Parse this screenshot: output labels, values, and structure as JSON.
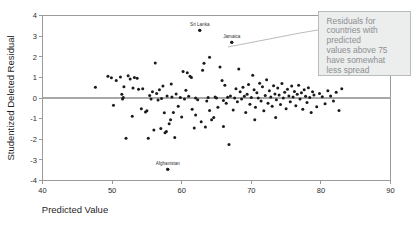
{
  "chart_data": {
    "type": "scatter",
    "title": "",
    "xlabel": "Predicted Value",
    "ylabel": "Studentized Deleted Residual",
    "xlim": [
      40,
      90
    ],
    "ylim": [
      -4,
      4
    ],
    "xticks": [
      40,
      50,
      60,
      70,
      80,
      90
    ],
    "yticks": [
      4,
      3,
      2,
      1,
      0,
      -1,
      -2,
      -3,
      -4
    ],
    "xtick_labels": [
      "40",
      "50",
      "60",
      "70",
      "80",
      "90"
    ],
    "ytick_labels": [
      "4",
      "3",
      "2",
      "1",
      "0",
      "-1",
      "-2",
      "-3",
      "-4"
    ],
    "grid": false,
    "legend": false,
    "reference_line": {
      "axis": "y",
      "value": 0,
      "color": "#a8a8a8"
    },
    "marker": {
      "shape": "circle",
      "color": "#1a1a1a",
      "size": 1.5
    },
    "points": [
      [
        47.6,
        0.52
      ],
      [
        49.4,
        1.05
      ],
      [
        49.9,
        0.98
      ],
      [
        50.2,
        -0.35
      ],
      [
        50.6,
        0.85
      ],
      [
        51.2,
        1.02
      ],
      [
        51.4,
        0.18
      ],
      [
        51.5,
        -0.05
      ],
      [
        51.6,
        0.02
      ],
      [
        51.7,
        0.55
      ],
      [
        52.0,
        -1.95
      ],
      [
        52.3,
        1.08
      ],
      [
        52.6,
        0.92
      ],
      [
        52.9,
        -0.88
      ],
      [
        53.2,
        1.0
      ],
      [
        53.6,
        0.96
      ],
      [
        53.8,
        0.42
      ],
      [
        54.2,
        -0.52
      ],
      [
        54.4,
        0.45
      ],
      [
        54.8,
        -0.68
      ],
      [
        55.0,
        -0.62
      ],
      [
        55.2,
        -1.95
      ],
      [
        55.4,
        0.12
      ],
      [
        55.6,
        -0.05
      ],
      [
        55.8,
        0.3
      ],
      [
        56.0,
        -1.55
      ],
      [
        56.2,
        1.7
      ],
      [
        56.4,
        0.22
      ],
      [
        56.6,
        -0.1
      ],
      [
        56.8,
        0.4
      ],
      [
        57.0,
        -1.48
      ],
      [
        57.1,
        -0.02
      ],
      [
        57.3,
        0.58
      ],
      [
        57.5,
        -0.72
      ],
      [
        57.6,
        -1.68
      ],
      [
        57.8,
        -1.62
      ],
      [
        57.9,
        0.1
      ],
      [
        58.0,
        -3.45
      ],
      [
        58.2,
        -1.25
      ],
      [
        58.4,
        -1.05
      ],
      [
        58.6,
        0.05
      ],
      [
        58.8,
        -0.7
      ],
      [
        59.0,
        -1.92
      ],
      [
        59.2,
        0.2
      ],
      [
        59.5,
        -0.4
      ],
      [
        59.8,
        0.03
      ],
      [
        60.2,
        1.28
      ],
      [
        60.4,
        -0.05
      ],
      [
        60.6,
        0.38
      ],
      [
        60.8,
        1.22
      ],
      [
        61.0,
        0.08
      ],
      [
        61.2,
        1.05
      ],
      [
        61.4,
        1.0
      ],
      [
        61.5,
        -0.55
      ],
      [
        61.8,
        -1.45
      ],
      [
        62.0,
        0.0
      ],
      [
        62.3,
        -0.08
      ],
      [
        62.6,
        3.28
      ],
      [
        62.8,
        -1.15
      ],
      [
        63.0,
        1.35
      ],
      [
        63.2,
        1.68
      ],
      [
        63.4,
        -1.4
      ],
      [
        63.6,
        -0.15
      ],
      [
        63.8,
        0.02
      ],
      [
        64.0,
        -0.6
      ],
      [
        64.3,
        -1.05
      ],
      [
        64.6,
        -0.95
      ],
      [
        64.8,
        0.05
      ],
      [
        65.0,
        0.0
      ],
      [
        65.2,
        -0.45
      ],
      [
        65.5,
        1.5
      ],
      [
        65.8,
        0.85
      ],
      [
        66.0,
        -0.12
      ],
      [
        66.2,
        0.62
      ],
      [
        66.4,
        -0.25
      ],
      [
        66.6,
        0.04
      ],
      [
        66.8,
        -2.25
      ],
      [
        67.0,
        0.1
      ],
      [
        67.2,
        2.7
      ],
      [
        67.4,
        -0.58
      ],
      [
        67.6,
        0.0
      ],
      [
        67.8,
        0.45
      ],
      [
        68.0,
        -0.18
      ],
      [
        68.2,
        1.4
      ],
      [
        68.4,
        0.3
      ],
      [
        68.6,
        -0.05
      ],
      [
        68.8,
        0.52
      ],
      [
        69.0,
        0.08
      ],
      [
        69.2,
        -0.7
      ],
      [
        69.4,
        0.18
      ],
      [
        69.6,
        0.66
      ],
      [
        69.8,
        -0.3
      ],
      [
        70.0,
        0.02
      ],
      [
        70.2,
        1.1
      ],
      [
        70.4,
        0.4
      ],
      [
        70.6,
        -0.45
      ],
      [
        70.8,
        0.25
      ],
      [
        71.0,
        0.0
      ],
      [
        71.2,
        0.72
      ],
      [
        71.4,
        -0.15
      ],
      [
        71.6,
        0.55
      ],
      [
        71.8,
        -0.62
      ],
      [
        72.0,
        0.12
      ],
      [
        72.2,
        0.88
      ],
      [
        72.4,
        -0.25
      ],
      [
        72.6,
        0.35
      ],
      [
        72.8,
        0.05
      ],
      [
        73.0,
        -0.4
      ],
      [
        73.2,
        0.6
      ],
      [
        73.4,
        0.2
      ],
      [
        73.6,
        -0.08
      ],
      [
        73.8,
        0.48
      ],
      [
        74.0,
        0.15
      ],
      [
        74.2,
        -0.32
      ],
      [
        74.4,
        0.7
      ],
      [
        74.6,
        0.0
      ],
      [
        74.8,
        0.28
      ],
      [
        75.0,
        -0.52
      ],
      [
        75.2,
        0.42
      ],
      [
        75.4,
        0.1
      ],
      [
        75.6,
        -0.18
      ],
      [
        75.8,
        0.58
      ],
      [
        76.0,
        0.05
      ],
      [
        76.2,
        0.32
      ],
      [
        76.4,
        -0.38
      ],
      [
        76.6,
        0.18
      ],
      [
        76.8,
        0.62
      ],
      [
        77.0,
        -0.05
      ],
      [
        77.2,
        0.25
      ],
      [
        77.4,
        -0.55
      ],
      [
        77.6,
        0.4
      ],
      [
        77.8,
        0.08
      ],
      [
        78.0,
        -0.22
      ],
      [
        78.2,
        0.5
      ],
      [
        78.4,
        0.02
      ],
      [
        78.6,
        -0.7
      ],
      [
        78.8,
        0.3
      ],
      [
        79.0,
        0.14
      ],
      [
        79.4,
        -0.42
      ],
      [
        79.8,
        0.22
      ],
      [
        80.2,
        0.06
      ],
      [
        80.6,
        -0.28
      ],
      [
        81.0,
        0.35
      ],
      [
        81.4,
        0.1
      ],
      [
        81.8,
        -0.15
      ],
      [
        82.2,
        0.28
      ],
      [
        82.6,
        -0.6
      ],
      [
        83.0,
        0.45
      ],
      [
        62.0,
        -0.82
      ],
      [
        64.0,
        1.98
      ],
      [
        58.5,
        0.68
      ],
      [
        53.0,
        0.48
      ],
      [
        60.0,
        -0.92
      ],
      [
        66.0,
        -1.38
      ],
      [
        70.5,
        -1.05
      ],
      [
        73.5,
        -0.95
      ]
    ],
    "point_labels": [
      {
        "text": "Sri Lanka",
        "x": 62.6,
        "y": 3.28
      },
      {
        "text": "Jamaica",
        "x": 67.2,
        "y": 2.7
      },
      {
        "text": "Afghanistan",
        "x": 58.0,
        "y": -3.45
      }
    ],
    "annotation": {
      "lines": [
        "Residuals for",
        "countries with",
        "predicted",
        "values above 75",
        "have somewhat",
        "less spread"
      ],
      "box_color": "#eceded",
      "border_color": "#b9bcbd",
      "text_color": "#8d9093"
    }
  }
}
